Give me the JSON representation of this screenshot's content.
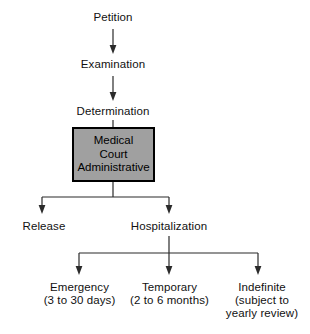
{
  "figure": {
    "background_color": "#ffffff",
    "line_color": "#2b2b2b",
    "text_color": "#111111"
  },
  "chain": {
    "step_1": "Petition",
    "step_2": "Examination",
    "step_3": "Determination"
  },
  "process_box": {
    "fill_color": "#a0a0a0",
    "border_color": "#000000",
    "line_1": "Medical",
    "line_2": "Court",
    "line_3": "Administrative"
  },
  "branch_1": {
    "outcome_left": "Release",
    "outcome_right": "Hospitalization"
  },
  "branch_2": {
    "outcome_left": "Emergency\n(3 to 30 days)",
    "outcome_middle": "Temporary\n(2 to 6 months)",
    "outcome_right": "Indefinite\n(subject to\nyearly review)"
  }
}
